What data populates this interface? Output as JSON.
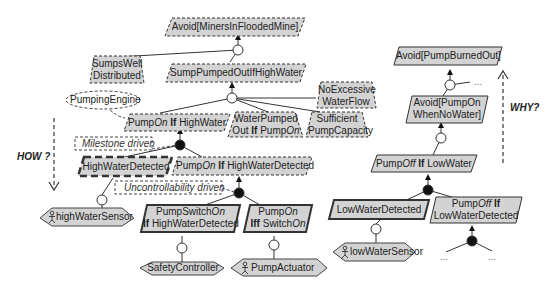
{
  "diagram": {
    "type": "goal-model",
    "colors": {
      "node_fill": "#d3d3d3",
      "stroke": "#333333",
      "background": "#ffffff"
    },
    "goals": [
      {
        "id": "g_avoid_miners",
        "label": "Avoid[MinersInFloodedMine]",
        "style": "dashed"
      },
      {
        "id": "g_sumps_well",
        "label_l1": "SumpsWell",
        "label_l2": "Distributed",
        "style": "dashed-trapezoid"
      },
      {
        "id": "g_sump_pumped",
        "label": "SumpPumpedOutIfHighWater",
        "style": "dashed"
      },
      {
        "id": "g_no_excessive",
        "label_l1": "NoExcessive",
        "label_l2": "WaterFlow",
        "style": "dashed-trapezoid"
      },
      {
        "id": "g_pumpon_hw",
        "pre": "Pump",
        "ital": "On",
        "kw": " If ",
        "post": "HighWater",
        "style": "dashed"
      },
      {
        "id": "g_water_pumped",
        "label_l1": "WaterPumped",
        "l2_pre": "Out ",
        "l2_kw": "If",
        "l2_mid": " Pump",
        "l2_ital": "On",
        "style": "dashed"
      },
      {
        "id": "g_sufficient",
        "label_l1": "Sufficient",
        "label_l2": "PumpCapacity",
        "style": "dashed-trapezoid"
      },
      {
        "id": "g_hw_detected",
        "label": "HighWaterDetected",
        "style": "thick-dashed"
      },
      {
        "id": "g_pumpon_hwd",
        "pre": "Pump",
        "ital": "On",
        "kw": " If ",
        "post": "HighWaterDetected",
        "style": "dashed"
      },
      {
        "id": "g_pumpswitch",
        "l1_pre": "PumpSwitch",
        "l1_ital": "On",
        "l2_kw": "If",
        "l2_post": " HighWaterDetected",
        "style": "solid-bold"
      },
      {
        "id": "g_pumpon_iff",
        "l1_pre": "Pump",
        "l1_ital": "On",
        "l2_kw": "Iff",
        "l2_post": " Switch",
        "l2_ital": "On",
        "style": "solid-bold"
      },
      {
        "id": "g_avoid_burned",
        "label": "Avoid[PumpBurnedOut]",
        "style": "solid"
      },
      {
        "id": "g_avoid_pumpon",
        "label_l1": "Avoid[PumpOn",
        "label_l2": "WhenNoWater]",
        "style": "solid"
      },
      {
        "id": "g_pumpoff_lw",
        "pre": "Pump",
        "ital": "Off",
        "kw": " If ",
        "post": "LowWater",
        "style": "solid"
      },
      {
        "id": "g_lw_detected",
        "label": "LowWaterDetected",
        "style": "solid-bold"
      },
      {
        "id": "g_pumpoff_lwd",
        "l1_pre": "Pump",
        "l1_ital": "Off",
        "l1_kw": " If",
        "label_l2": "LowWaterDetected",
        "style": "solid"
      }
    ],
    "agents": [
      {
        "id": "a_hw_sensor",
        "label": "highWaterSensor",
        "has_person_icon": true
      },
      {
        "id": "a_safety",
        "label": "SafetyController",
        "has_person_icon": false
      },
      {
        "id": "a_actuator",
        "label": "PumpActuator",
        "has_person_icon": true
      },
      {
        "id": "a_lw_sensor",
        "label": "lowWaterSensor",
        "has_person_icon": true
      }
    ],
    "domain_property": {
      "label": "PumpingEngine"
    },
    "annotations": {
      "milestone": "Milestone driven",
      "uncontrollability": "Uncontrollability driven"
    },
    "axes": {
      "how": "HOW ?",
      "why": "WHY?"
    },
    "ellipsis": "..."
  }
}
